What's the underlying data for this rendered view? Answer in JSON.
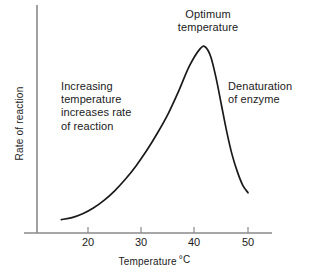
{
  "chart_data": {
    "type": "line",
    "title": "",
    "xlabel": "Temperature",
    "xlabel_unit": "°C",
    "ylabel": "Rate of reaction",
    "xlim": [
      14,
      51
    ],
    "ylim": [
      0,
      100
    ],
    "grid": false,
    "legend": null,
    "xticks": [
      20,
      30,
      40,
      50
    ],
    "xtick_labels": [
      "20",
      "30",
      "40",
      "50"
    ],
    "ytick_labels": [],
    "series": [
      {
        "name": "Rate of reaction vs temperature",
        "x": [
          15,
          17,
          19,
          21,
          23,
          25,
          27,
          29,
          31,
          33,
          35,
          37,
          39,
          41,
          42,
          43,
          44,
          45,
          46,
          47,
          48,
          49,
          50
        ],
        "y": [
          7,
          8,
          10,
          13,
          17,
          22,
          28,
          35,
          43,
          52,
          62,
          74,
          87,
          96,
          97,
          92,
          81,
          67,
          53,
          41,
          32,
          25,
          21
        ]
      }
    ],
    "annotations": [
      {
        "id": "increasing",
        "text": "Increasing\ntemperature\nincreases rate\nof reaction",
        "lines": [
          "Increasing",
          "temperature",
          "increases rate",
          "of reaction"
        ]
      },
      {
        "id": "optimum",
        "text": "Optimum\ntemperature",
        "lines": [
          "Optimum",
          "temperature"
        ]
      },
      {
        "id": "denaturation",
        "text": "Denaturation\nof enzyme",
        "lines": [
          "Denaturation",
          "of enzyme"
        ]
      }
    ],
    "colors": {
      "curve": "#1a1a1a",
      "axis": "#8a8a8a",
      "text": "#1a1a1a",
      "background": "#ffffff"
    }
  },
  "axis": {
    "x_tick_20": "20",
    "x_tick_30": "30",
    "x_tick_40": "40",
    "x_tick_50": "50",
    "x_title": "Temperature",
    "x_unit": "°C",
    "y_title": "Rate of reaction"
  },
  "annotations": {
    "increasing": "Increasing\ntemperature\nincreases rate\nof reaction",
    "optimum": "Optimum\ntemperature",
    "denaturation": "Denaturation\nof enzyme"
  }
}
